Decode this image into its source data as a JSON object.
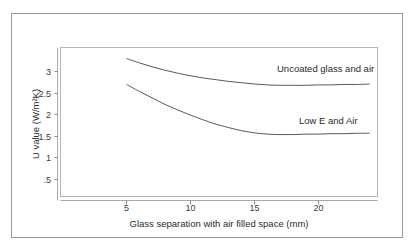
{
  "figure": {
    "frame_color": "#9a9a9a",
    "background": "#ffffff",
    "line_color": "#585858"
  },
  "chart_data": {
    "type": "line",
    "title": "",
    "xlabel": "Glass separation with air filled space (mm)",
    "ylabel": "U value (W/m²K)",
    "xlim": [
      0,
      24
    ],
    "ylim": [
      0,
      3.5
    ],
    "xticks": [
      5,
      10,
      15,
      20
    ],
    "xtick_labels": [
      "5",
      "10",
      "15",
      "20"
    ],
    "yticks": [
      0.5,
      1,
      1.5,
      2,
      2.5,
      3
    ],
    "ytick_labels": [
      ".5",
      "1",
      "1.5",
      "2",
      "2.5",
      "3"
    ],
    "grid": false,
    "legend_position": "inline-right",
    "series": [
      {
        "name": "Uncoated glass and air",
        "label": "Uncoated glass and air",
        "color": "#585858",
        "x": [
          5,
          6,
          7,
          8,
          9,
          10,
          11,
          12,
          13,
          14,
          15,
          16,
          17,
          18,
          19,
          20,
          21,
          22,
          23,
          24
        ],
        "values": [
          3.3,
          3.2,
          3.11,
          3.03,
          2.96,
          2.9,
          2.85,
          2.81,
          2.77,
          2.74,
          2.71,
          2.69,
          2.68,
          2.68,
          2.68,
          2.69,
          2.69,
          2.7,
          2.7,
          2.71
        ]
      },
      {
        "name": "Low E and Air",
        "label": "Low E and Air",
        "color": "#585858",
        "x": [
          5,
          6,
          7,
          8,
          9,
          10,
          11,
          12,
          13,
          14,
          15,
          16,
          17,
          18,
          19,
          20,
          21,
          22,
          23,
          24
        ],
        "values": [
          2.7,
          2.54,
          2.39,
          2.24,
          2.11,
          1.99,
          1.88,
          1.78,
          1.7,
          1.63,
          1.58,
          1.55,
          1.54,
          1.54,
          1.55,
          1.55,
          1.56,
          1.56,
          1.57,
          1.57
        ]
      }
    ],
    "annotations": [
      {
        "text": "Uncoated glass and air",
        "x": 17.0,
        "y": 2.97
      },
      {
        "text": "Low E and Air",
        "x": 18.6,
        "y": 1.85
      }
    ]
  }
}
